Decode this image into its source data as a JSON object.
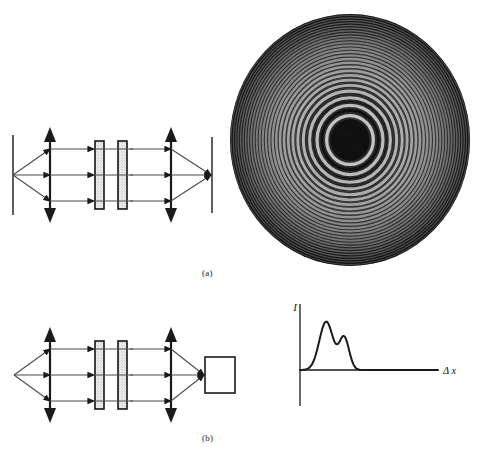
{
  "figure": {
    "background_color": "#ffffff",
    "ink_color": "#1a1a1a",
    "width": 480,
    "height": 462
  },
  "captions": {
    "a": "(a)",
    "b": "(b)"
  },
  "diagram_a": {
    "name": "interferometer-with-screen",
    "elements": {
      "source_plane_label": "source plane",
      "lens_left_label": "collimating lens",
      "plate_1_label": "beam splitter plate 1",
      "plate_2_label": "beam splitter plate 2",
      "lens_right_label": "focusing lens",
      "screen_label": "observation screen"
    },
    "ray_count": 3,
    "plate_count": 2,
    "lens_count": 2
  },
  "diagram_b": {
    "name": "interferometer-with-detector",
    "elements": {
      "lens_left_label": "collimating lens",
      "plate_1_label": "beam splitter plate 1",
      "plate_2_label": "beam splitter plate 2",
      "lens_right_label": "focusing lens",
      "detector_label": "detector"
    },
    "ray_count": 3,
    "plate_count": 2,
    "lens_count": 2
  },
  "rings": {
    "name": "circular-interference-fringes",
    "description": "Haidinger circular fringes, bright concentric rings on dark disk",
    "center_x": 126,
    "center_y": 130,
    "disk_radius": 126,
    "background_color": "#050505",
    "fringe_color": "#d8d8d8",
    "ring_count": 26,
    "center_is_dark": true
  },
  "chart_data": {
    "type": "line",
    "title": "",
    "xlabel": "Δ x",
    "ylabel": "I",
    "xlim": [
      0,
      100
    ],
    "ylim": [
      0,
      100
    ],
    "grid": false,
    "legend": null,
    "annotations": [
      {
        "text": "I",
        "role": "y-axis-label"
      },
      {
        "text": "Δ x",
        "role": "x-axis-label"
      }
    ],
    "series": [
      {
        "name": "detected intensity",
        "peaks": [
          {
            "center": 19,
            "height": 78,
            "width": 5.0
          },
          {
            "center": 32,
            "height": 52,
            "width": 3.6
          }
        ],
        "baseline": 0,
        "x": [
          0,
          4,
          8,
          11,
          13,
          15,
          17,
          18,
          19,
          20,
          21,
          23,
          25,
          26,
          27,
          28,
          30,
          31,
          32,
          33,
          34,
          36,
          38,
          41,
          45,
          52,
          62,
          75,
          90,
          100
        ],
        "y": [
          0,
          0,
          1,
          3,
          8,
          22,
          52,
          70,
          78,
          72,
          55,
          22,
          8,
          6,
          8,
          16,
          40,
          50,
          52,
          48,
          36,
          16,
          7,
          3,
          1,
          0,
          0,
          0,
          0,
          0
        ]
      }
    ]
  }
}
